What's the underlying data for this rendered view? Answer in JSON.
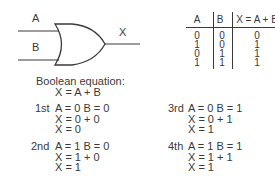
{
  "gate": {
    "type": "OR",
    "input_a_label": "A",
    "input_b_label": "B",
    "output_label": "X"
  },
  "truth_table": {
    "headers": [
      "A",
      "B",
      "X = A + B"
    ],
    "rows": [
      [
        "0",
        "0",
        "0"
      ],
      [
        "1",
        "0",
        "1"
      ],
      [
        "0",
        "1",
        "1"
      ],
      [
        "1",
        "1",
        "1"
      ]
    ]
  },
  "equation": {
    "title": "Boolean equation:",
    "formula": "X = A + B"
  },
  "cases": [
    {
      "ordinal": "1st",
      "inputs": "A = 0  B = 0",
      "step": "X = 0 + 0",
      "result": "X = 0"
    },
    {
      "ordinal": "2nd",
      "inputs": "A = 1  B = 0",
      "step": "X = 1 + 0",
      "result": "X = 1"
    },
    {
      "ordinal": "3rd",
      "inputs": "A = 0  B = 1",
      "step": "X = 0 + 1",
      "result": "X = 1"
    },
    {
      "ordinal": "4th",
      "inputs": "A = 1  B = 1",
      "step": "X = 1 + 1",
      "result": "X = 1"
    }
  ]
}
